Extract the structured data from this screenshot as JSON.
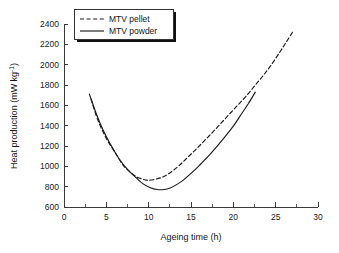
{
  "chart_data": {
    "type": "line",
    "title": "",
    "xlabel": "Ageing time (h)",
    "ylabel": "Heat production (mW kg⁻¹)",
    "ylabel_main": "Heat production (mW kg",
    "ylabel_sup": "-1",
    "ylabel_tail": ")",
    "xlim": [
      0,
      30
    ],
    "ylim": [
      600,
      2400
    ],
    "grid": false,
    "legend_position": "top-left",
    "xticks": [
      0,
      5,
      10,
      15,
      20,
      25,
      30
    ],
    "xtick_labels": [
      "0",
      "5",
      "10",
      "15",
      "20",
      "25",
      "30"
    ],
    "yticks": [
      600,
      800,
      1000,
      1200,
      1400,
      1600,
      1800,
      2000,
      2200,
      2400
    ],
    "ytick_labels": [
      "600",
      "800",
      "1000",
      "1200",
      "1400",
      "1600",
      "1800",
      "2000",
      "2200",
      "2400"
    ],
    "x_minor_step": 2.5,
    "series": [
      {
        "name": "MTV pellet",
        "style": "dashed",
        "color": "#1b1b1b",
        "x": [
          3.2,
          4.0,
          5.0,
          6.0,
          7.0,
          7.6,
          8.5,
          9.2,
          9.8,
          10.5,
          11.5,
          12.5,
          13.5,
          14.5,
          15.5,
          16.5,
          17.5,
          18.5,
          19.5,
          20.5,
          21.5,
          22.5,
          23.5,
          24.5,
          25.5,
          26.2,
          27.0
        ],
        "y": [
          1660,
          1455,
          1275,
          1140,
          1010,
          960,
          900,
          876,
          865,
          868,
          890,
          935,
          1000,
          1080,
          1160,
          1245,
          1330,
          1420,
          1510,
          1600,
          1690,
          1790,
          1890,
          2000,
          2125,
          2215,
          2320
        ]
      },
      {
        "name": "MTV powder",
        "style": "solid",
        "color": "#1b1b1b",
        "x": [
          3.0,
          3.8,
          4.6,
          5.5,
          6.5,
          7.6,
          8.5,
          9.3,
          10.2,
          11.0,
          11.8,
          12.6,
          13.4,
          14.2,
          15.0,
          16.0,
          17.0,
          18.0,
          19.0,
          20.0,
          21.0,
          21.8,
          22.6
        ],
        "y": [
          1710,
          1520,
          1360,
          1215,
          1075,
          960,
          890,
          830,
          790,
          772,
          772,
          790,
          825,
          872,
          930,
          1010,
          1095,
          1190,
          1290,
          1395,
          1520,
          1620,
          1730
        ]
      }
    ],
    "legend": [
      {
        "label": "MTV pellet",
        "style": "dashed"
      },
      {
        "label": "MTV powder",
        "style": "solid"
      }
    ]
  }
}
